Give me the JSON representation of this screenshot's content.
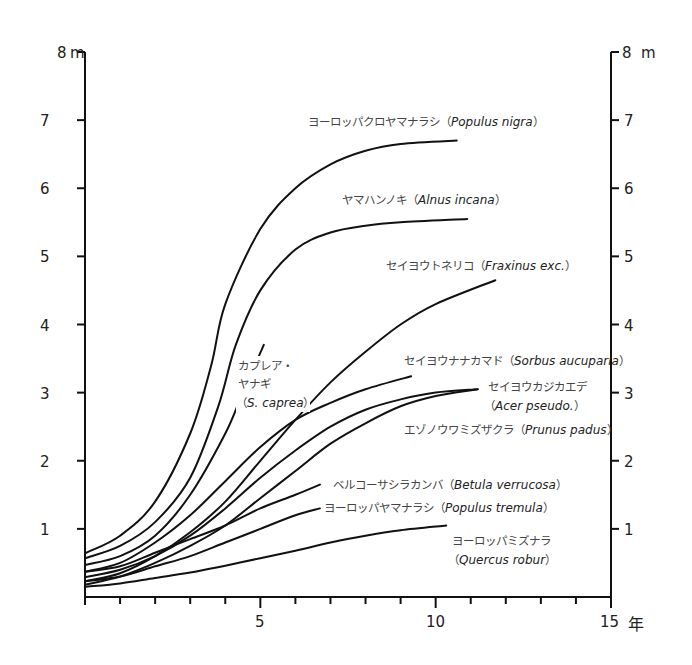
{
  "chart_data": {
    "type": "line",
    "title": "",
    "xlabel": "年",
    "ylabel": "m",
    "xlim": [
      0,
      15
    ],
    "ylim": [
      0,
      8
    ],
    "x_ticks_major": [
      5,
      10,
      15
    ],
    "x_ticks_minor_step": 1,
    "y_ticks": [
      1,
      2,
      3,
      4,
      5,
      6,
      7,
      8
    ],
    "y_top_label": "8 m",
    "grid": false,
    "legend": "inline labels near curve ends",
    "axes": "left and right y-axes, bottom x-axis",
    "series": [
      {
        "id": "populus-nigra",
        "name_ja": "ヨーロッパクロヤマナラシ",
        "name_latin": "Populus nigra",
        "points": [
          [
            0,
            0.64
          ],
          [
            1,
            0.9
          ],
          [
            2,
            1.4
          ],
          [
            3,
            2.4
          ],
          [
            3.6,
            3.4
          ],
          [
            4,
            4.3
          ],
          [
            5,
            5.4
          ],
          [
            6,
            6.0
          ],
          [
            7,
            6.35
          ],
          [
            8,
            6.55
          ],
          [
            9,
            6.65
          ],
          [
            10.6,
            6.7
          ]
        ],
        "label_pos": [
          232,
          126
        ]
      },
      {
        "id": "alnus-incana",
        "name_ja": "ヤマハンノキ",
        "name_latin": "Alnus incana",
        "points": [
          [
            0,
            0.57
          ],
          [
            1,
            0.75
          ],
          [
            2,
            1.1
          ],
          [
            3,
            1.75
          ],
          [
            3.8,
            2.8
          ],
          [
            4.3,
            3.7
          ],
          [
            5,
            4.5
          ],
          [
            6,
            5.1
          ],
          [
            7,
            5.35
          ],
          [
            8,
            5.45
          ],
          [
            9,
            5.5
          ],
          [
            10.9,
            5.55
          ]
        ],
        "label_pos": [
          342,
          204
        ]
      },
      {
        "id": "fraxinus-exc",
        "name_ja": "セイヨウトネリコ",
        "name_latin": "Fraxinus exc.",
        "points": [
          [
            0,
            0.23
          ],
          [
            1,
            0.35
          ],
          [
            2,
            0.6
          ],
          [
            3,
            0.95
          ],
          [
            4,
            1.4
          ],
          [
            5,
            2.0
          ],
          [
            6,
            2.6
          ],
          [
            7,
            3.15
          ],
          [
            8,
            3.6
          ],
          [
            9,
            4.0
          ],
          [
            10,
            4.3
          ],
          [
            11.7,
            4.65
          ]
        ],
        "label_pos": [
          386,
          268
        ]
      },
      {
        "id": "salix-caprea",
        "name_ja": "カプレア・ヤナギ",
        "name_latin": "S. caprea",
        "label_lines": [
          "カプレア・",
          "ヤナギ",
          "（S. caprea）"
        ],
        "points": [
          [
            0,
            0.47
          ],
          [
            1,
            0.6
          ],
          [
            2,
            0.9
          ],
          [
            3,
            1.5
          ],
          [
            4,
            2.4
          ],
          [
            4.5,
            3.0
          ],
          [
            5.1,
            3.7
          ]
        ],
        "label_pos": [
          238,
          370
        ]
      },
      {
        "id": "sorbus-aucuparia",
        "name_ja": "セイヨウナナカマド",
        "name_latin": "Sorbus aucuparia",
        "points": [
          [
            0,
            0.37
          ],
          [
            1,
            0.5
          ],
          [
            2,
            0.8
          ],
          [
            3,
            1.2
          ],
          [
            4,
            1.7
          ],
          [
            5,
            2.2
          ],
          [
            6,
            2.6
          ],
          [
            7,
            2.85
          ],
          [
            8,
            3.05
          ],
          [
            9.3,
            3.24
          ]
        ],
        "label_pos": [
          404,
          364
        ]
      },
      {
        "id": "acer-pseudo",
        "name_ja": "セイヨウカジカエデ",
        "name_latin": "Acer pseudo.",
        "label_lines": [
          "セイヨウカジカエデ",
          "（Acer pseudo.）"
        ],
        "points": [
          [
            0,
            0.29
          ],
          [
            1,
            0.4
          ],
          [
            2,
            0.6
          ],
          [
            3,
            0.9
          ],
          [
            4,
            1.3
          ],
          [
            5,
            1.75
          ],
          [
            6,
            2.15
          ],
          [
            7,
            2.5
          ],
          [
            8,
            2.75
          ],
          [
            9,
            2.9
          ],
          [
            10,
            3.0
          ],
          [
            11.2,
            3.05
          ]
        ],
        "label_pos": [
          488,
          390
        ]
      },
      {
        "id": "prunus-padus",
        "name_ja": "エゾノウワミズザクラ",
        "name_latin": "Prunus padus",
        "points": [
          [
            0,
            0.18
          ],
          [
            1,
            0.3
          ],
          [
            2,
            0.5
          ],
          [
            3,
            0.75
          ],
          [
            4,
            1.05
          ],
          [
            5,
            1.45
          ],
          [
            6,
            1.85
          ],
          [
            7,
            2.25
          ],
          [
            8,
            2.55
          ],
          [
            9,
            2.8
          ],
          [
            10,
            2.95
          ],
          [
            11.2,
            3.05
          ]
        ],
        "label_pos": [
          404,
          434
        ]
      },
      {
        "id": "betula-verrucosa",
        "name_ja": "ベルコーサシラカンバ",
        "name_latin": "Betula verrucosa",
        "points": [
          [
            0,
            0.37
          ],
          [
            1,
            0.45
          ],
          [
            2,
            0.65
          ],
          [
            3,
            0.85
          ],
          [
            4,
            1.05
          ],
          [
            5,
            1.3
          ],
          [
            6,
            1.5
          ],
          [
            6.7,
            1.65
          ]
        ],
        "label_pos": [
          334,
          488
        ]
      },
      {
        "id": "populus-tremula",
        "name_ja": "ヨーロッパヤマナラシ",
        "name_latin": "Populus tremula",
        "points": [
          [
            0,
            0.23
          ],
          [
            1,
            0.3
          ],
          [
            2,
            0.45
          ],
          [
            3,
            0.6
          ],
          [
            4,
            0.8
          ],
          [
            5,
            1.0
          ],
          [
            6,
            1.2
          ],
          [
            6.7,
            1.3
          ]
        ],
        "label_pos": [
          324,
          511
        ]
      },
      {
        "id": "quercus-robur",
        "name_ja": "ヨーロッパミズナラ",
        "name_latin": "Quercus robur",
        "label_lines": [
          "ヨーロッパミズナラ",
          "（Quercus robur）"
        ],
        "points": [
          [
            0,
            0.15
          ],
          [
            1,
            0.2
          ],
          [
            2,
            0.28
          ],
          [
            3,
            0.36
          ],
          [
            4,
            0.46
          ],
          [
            5,
            0.57
          ],
          [
            6,
            0.68
          ],
          [
            7,
            0.8
          ],
          [
            8,
            0.9
          ],
          [
            9,
            0.98
          ],
          [
            10.3,
            1.05
          ]
        ],
        "label_pos": [
          452,
          544
        ]
      }
    ]
  },
  "axes": {
    "left_top_label": "8",
    "left_top_unit": "m",
    "right_top_label": "8",
    "right_top_unit": "m",
    "x_unit": "年",
    "y_tick_labels": [
      "1",
      "2",
      "3",
      "4",
      "5",
      "6",
      "7"
    ],
    "x_tick_labels": [
      "5",
      "10",
      "15"
    ]
  },
  "labels": {
    "populus_nigra_ja": "ヨーロッパクロヤマナラシ（",
    "populus_nigra_latin": "Populus nigra",
    "alnus_ja": "ヤマハンノキ（",
    "alnus_latin": "Alnus incana",
    "fraxinus_ja": "セイヨウトネリコ（",
    "fraxinus_latin": "Fraxinus exc.",
    "salix_line1": "カプレア・",
    "salix_line2": "ヤナギ",
    "salix_paren_open": "（",
    "salix_latin": "S. caprea",
    "sorbus_ja": "セイヨウナナカマド（",
    "sorbus_latin": "Sorbus aucuparia",
    "acer_line1": "セイヨウカジカエデ",
    "acer_paren_open": "（",
    "acer_latin": "Acer pseudo.",
    "prunus_ja": "エゾノウワミズザクラ（",
    "prunus_latin": "Prunus padus",
    "betula_ja": "ベルコーサシラカンバ（",
    "betula_latin": "Betula verrucosa",
    "tremula_ja": "ヨーロッパヤマナラシ（",
    "tremula_latin": "Populus tremula",
    "quercus_line1": "ヨーロッパミズナラ",
    "quercus_paren_open": "（",
    "quercus_latin": "Quercus robur",
    "close_paren": "）"
  }
}
